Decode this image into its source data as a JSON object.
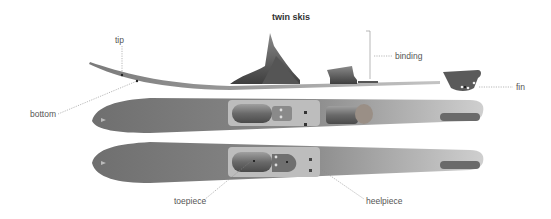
{
  "title": "twin skis",
  "labels": {
    "tip": "tip",
    "binding": "binding",
    "fin": "fin",
    "bottom": "bottom",
    "toepiece": "toepiece",
    "heelpiece": "heelpiece"
  },
  "colors": {
    "ski_dark": "#6e6e6e",
    "ski_mid": "#8c8c8c",
    "ski_light": "#c8c8c8",
    "binding_dark": "#4a4a4a",
    "leader_line": "#888888",
    "text": "#555555"
  }
}
